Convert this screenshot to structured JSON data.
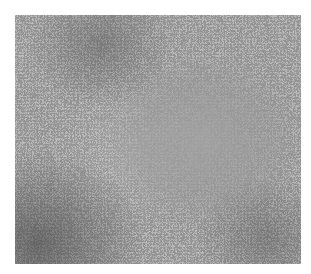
{
  "caption": {
    "visible_text": ""
  },
  "figure": {
    "type": "histology-micrograph",
    "stain": "grayscale",
    "colors": {
      "background": "#ffffff",
      "tissue_mid": "#8e8e8e",
      "pale_center": "#9c9c9c",
      "dense_region": "#6a6a6a",
      "nuclei": "#2e2e2e",
      "highlights": "#d6d6d6"
    }
  }
}
